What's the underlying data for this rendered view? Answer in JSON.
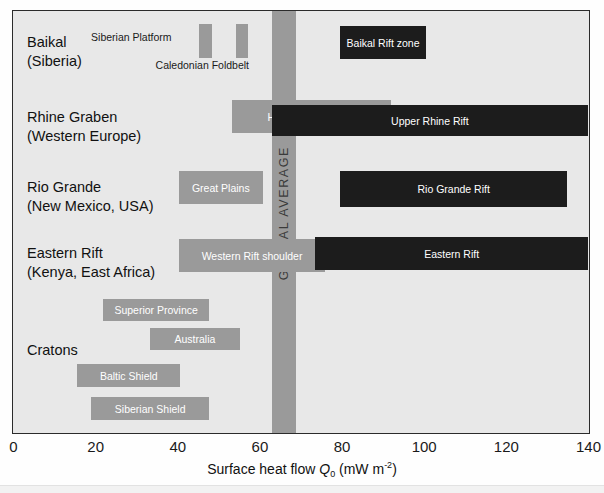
{
  "chart_data": {
    "type": "bar",
    "title": "",
    "xlabel": "Surface heat flow Q0 (mW m-2)",
    "xlabel_parts": {
      "prefix": "Surface heat flow ",
      "symbol": "Q",
      "symbol_sub": "0",
      "units_open": " (mW m",
      "units_sup": "-2",
      "units_close": ")"
    },
    "ylabel": "",
    "xlim": [
      0,
      140
    ],
    "xticks": [
      0,
      20,
      40,
      60,
      80,
      100,
      120,
      140
    ],
    "xtick_labels": [
      "0",
      "20",
      "40",
      "60",
      "80",
      "100",
      "120",
      "140"
    ],
    "grid": false,
    "legend": "none",
    "annotations": [
      {
        "name": "global-average-band",
        "label": "GLOBAL AVERAGE",
        "x_start": 63,
        "x_end": 69,
        "color": "#9a9a9a"
      }
    ],
    "categories": [
      "Baikal (Siberia)",
      "Rhine Graben (Western Europe)",
      "Rio Grande (New Mexico, USA)",
      "Eastern Rift (Kenya, East Africa)",
      "Cratons"
    ],
    "rows": [
      {
        "label_line1": "Baikal",
        "label_line2": "(Siberia)",
        "bars": [
          {
            "name": "siberian-platform",
            "label": "Siberian Platform",
            "x_start": 45.3,
            "x_end": 48.4,
            "color": "#9a9a9a",
            "label_placement": "left-outside"
          },
          {
            "name": "caledonian-foldbelt",
            "label": "Caledonian Foldbelt",
            "x_start": 54.2,
            "x_end": 57.1,
            "color": "#9a9a9a",
            "label_placement": "below-outside"
          },
          {
            "name": "baikal-rift-zone",
            "label": "Baikal Rift zone",
            "x_start": 79.7,
            "x_end": 100.5,
            "color": "#1c1c1c",
            "label_placement": "inside"
          }
        ]
      },
      {
        "label_line1": "Rhine Graben",
        "label_line2": "(Western Europe)",
        "bars": [
          {
            "name": "hercynian-foldbelt",
            "label": "Hercynian Foldbelt",
            "x_start": 53.2,
            "x_end": 92.0,
            "color": "#9a9a9a",
            "label_placement": "inside"
          },
          {
            "name": "upper-rhine-rift",
            "label": "Upper Rhine Rift",
            "x_start": 63.0,
            "x_end": 140.0,
            "color": "#1c1c1c",
            "label_placement": "inside"
          }
        ]
      },
      {
        "label_line1": "Rio Grande",
        "label_line2": "(New Mexico, USA)",
        "bars": [
          {
            "name": "great-plains",
            "label": "Great Plains",
            "x_start": 40.4,
            "x_end": 60.8,
            "color": "#9a9a9a",
            "label_placement": "inside"
          },
          {
            "name": "rio-grande-rift",
            "label": "Rio Grande Rift",
            "x_start": 79.7,
            "x_end": 134.9,
            "color": "#1c1c1c",
            "label_placement": "inside"
          }
        ]
      },
      {
        "label_line1": "Eastern Rift",
        "label_line2": "(Kenya, East Africa)",
        "bars": [
          {
            "name": "western-rift-shoulder",
            "label": "Western Rift shoulder",
            "x_start": 40.4,
            "x_end": 76.0,
            "color": "#9a9a9a",
            "label_placement": "inside"
          },
          {
            "name": "eastern-rift",
            "label": "Eastern Rift",
            "x_start": 73.6,
            "x_end": 140.0,
            "color": "#1c1c1c",
            "label_placement": "inside"
          }
        ]
      },
      {
        "label_line1": "Cratons",
        "label_line2": "",
        "bars": [
          {
            "name": "superior-province",
            "label": "Superior Province",
            "x_start": 22.0,
            "x_end": 47.7,
            "color": "#9a9a9a",
            "label_placement": "inside"
          },
          {
            "name": "australia",
            "label": "Australia",
            "x_start": 33.4,
            "x_end": 55.2,
            "color": "#9a9a9a",
            "label_placement": "inside"
          },
          {
            "name": "baltic-shield",
            "label": "Baltic Shield",
            "x_start": 15.7,
            "x_end": 40.7,
            "color": "#9a9a9a",
            "label_placement": "inside"
          },
          {
            "name": "siberian-shield",
            "label": "Siberian Shield",
            "x_start": 19.1,
            "x_end": 47.7,
            "color": "#9a9a9a",
            "label_placement": "inside"
          }
        ]
      }
    ]
  },
  "colors": {
    "plot_background": "#e8e8e8",
    "page_background": "#fefefe",
    "bar_gray": "#9a9a9a",
    "bar_dark": "#1c1c1c",
    "band_gray": "#9a9a9a",
    "border": "#2b2b2b",
    "text": "#111111",
    "label_on_bar": "#ffffff"
  }
}
